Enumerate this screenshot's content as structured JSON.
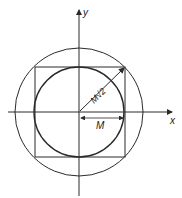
{
  "diagram": {
    "axes": {
      "x_label": "x",
      "y_label": "y"
    },
    "labels": {
      "radius_inner": "M",
      "radius_outer": "M√2"
    },
    "shapes": {
      "outer_circle": "circumscribed circle",
      "inner_circle": "inscribed circle",
      "square": "square"
    },
    "colors": {
      "stroke": "#2a2a2a",
      "background": "#ffffff"
    }
  }
}
